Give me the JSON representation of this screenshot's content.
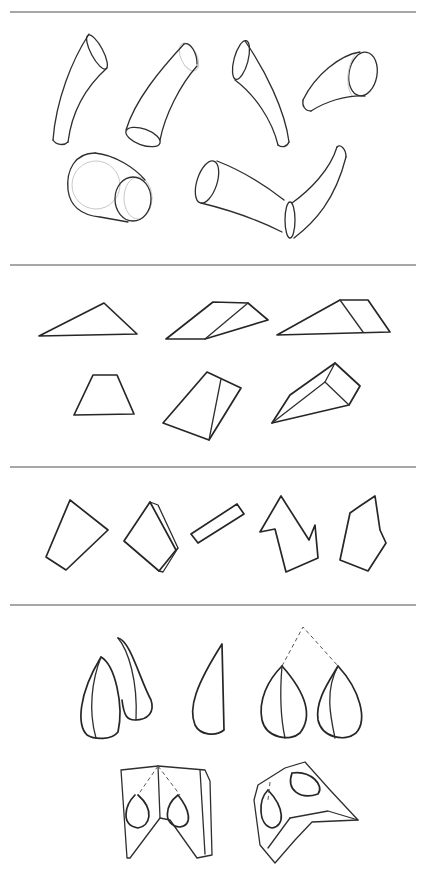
{
  "page": {
    "type": "sketch-sheet",
    "background": "#ffffff",
    "ink_color": "#2e2e2e",
    "divider_color": "#8a8a8a"
  },
  "dividers": [
    {
      "y": 12
    },
    {
      "y": 265
    },
    {
      "y": 467
    },
    {
      "y": 605
    }
  ],
  "sections": [
    {
      "name": "curved-cylinders",
      "shape_count": 6
    },
    {
      "name": "wedges-and-prisms",
      "shape_count": 6
    },
    {
      "name": "flat-polygons",
      "shape_count": 5
    },
    {
      "name": "teardrops-and-folded-forms",
      "shape_count": 5
    }
  ]
}
